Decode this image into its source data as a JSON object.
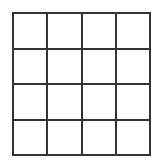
{
  "diagram": {
    "type": "grid",
    "rows": 4,
    "columns": 4,
    "line_color": "#333333",
    "background_color": "#ffffff",
    "cells": [
      [
        "",
        "",
        "",
        ""
      ],
      [
        "",
        "",
        "",
        ""
      ],
      [
        "",
        "",
        "",
        ""
      ],
      [
        "",
        "",
        "",
        ""
      ]
    ]
  }
}
